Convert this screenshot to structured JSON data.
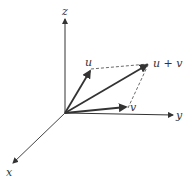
{
  "diagram": {
    "type": "3d-vector-addition",
    "axes": [
      {
        "name": "x",
        "label": "x"
      },
      {
        "name": "y",
        "label": "y"
      },
      {
        "name": "z",
        "label": "z"
      }
    ],
    "vectors": [
      {
        "name": "u",
        "label": "u"
      },
      {
        "name": "v",
        "label": "v"
      },
      {
        "name": "u_plus_v",
        "label": "u + v"
      }
    ],
    "colors": {
      "ink": "#333333",
      "background": "#ffffff"
    }
  }
}
